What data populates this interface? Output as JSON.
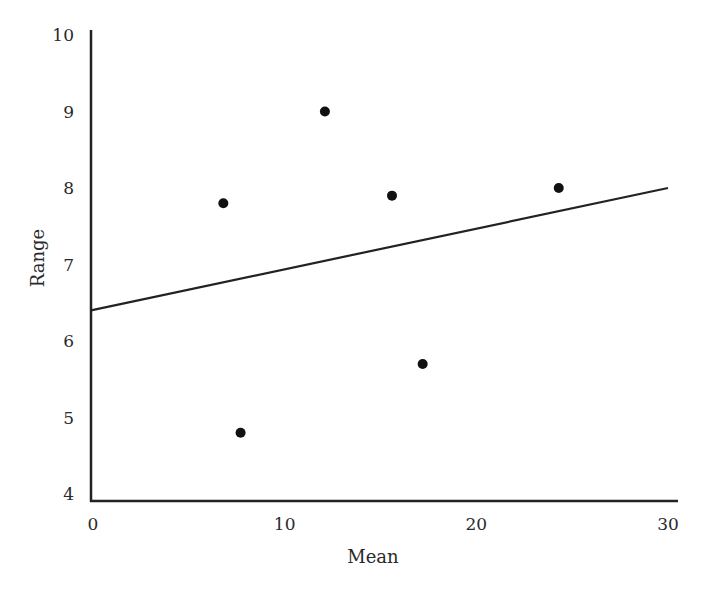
{
  "chart_data": {
    "type": "scatter",
    "title": "",
    "xlabel": "Mean",
    "ylabel": "Range",
    "xlim": [
      0,
      30
    ],
    "ylim": [
      4,
      10
    ],
    "xticks": [
      0,
      10,
      20,
      30
    ],
    "xtick_labels": [
      "0",
      "10",
      "20",
      "30"
    ],
    "yticks": [
      4,
      5,
      6,
      7,
      8,
      9,
      10
    ],
    "ytick_labels": [
      "4",
      "5",
      "6",
      "7",
      "8",
      "9",
      "10"
    ],
    "grid": false,
    "legend": null,
    "series": [
      {
        "name": "points",
        "type": "scatter",
        "x": [
          6.8,
          7.7,
          12.1,
          15.6,
          17.2,
          24.3
        ],
        "y": [
          7.8,
          4.8,
          9.0,
          7.9,
          5.7,
          8.0
        ]
      },
      {
        "name": "fitted line",
        "type": "line",
        "x": [
          0,
          30
        ],
        "y": [
          6.4,
          8.0
        ]
      }
    ],
    "colors": {
      "points": "#111111",
      "line": "#222222",
      "axes": "#222222"
    }
  },
  "labels": {
    "x_axis": "Mean",
    "y_axis": "Range"
  }
}
